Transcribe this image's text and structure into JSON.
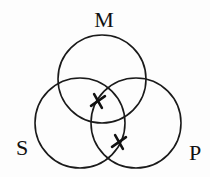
{
  "diagram": {
    "type": "venn",
    "sets": [
      {
        "id": "M",
        "label": "M",
        "cx": 102,
        "cy": 79,
        "r": 44,
        "label_x": 104,
        "label_y": 27
      },
      {
        "id": "S",
        "label": "S",
        "cx": 80,
        "cy": 123,
        "r": 45,
        "label_x": 22,
        "label_y": 155
      },
      {
        "id": "P",
        "label": "P",
        "cx": 136,
        "cy": 123,
        "r": 45,
        "label_x": 195,
        "label_y": 160
      }
    ],
    "markers": [
      {
        "symbol": "x",
        "region": "M∩S∩P (upper)",
        "x": 98,
        "y": 101
      },
      {
        "symbol": "x",
        "region": "S∩P outside M",
        "x": 119,
        "y": 142
      }
    ],
    "stroke_color": "#1a1a1a"
  }
}
